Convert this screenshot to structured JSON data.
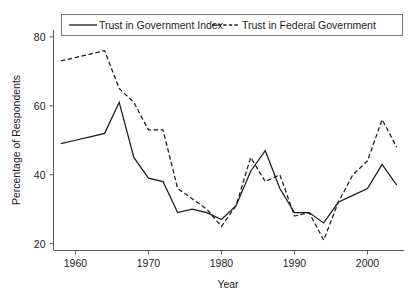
{
  "chart_data": {
    "type": "line",
    "title": "",
    "xlabel": "Year",
    "ylabel": "Percentage of Respondents",
    "xlim": [
      1957,
      2005
    ],
    "ylim": [
      18,
      82
    ],
    "xticks": [
      "1960",
      "1970",
      "1980",
      "1990",
      "2000"
    ],
    "xtick_values": [
      1960,
      1970,
      1980,
      1990,
      2000
    ],
    "yticks": [
      "20",
      "40",
      "60",
      "80"
    ],
    "ytick_values": [
      20,
      40,
      60,
      80
    ],
    "grid": false,
    "legend_position": "top",
    "series": [
      {
        "name": "Trust in Government Index",
        "style": "solid",
        "x": [
          1958,
          1960,
          1962,
          1964,
          1966,
          1968,
          1970,
          1972,
          1974,
          1976,
          1978,
          1980,
          1982,
          1984,
          1986,
          1988,
          1990,
          1992,
          1994,
          1996,
          1998,
          2000,
          2002,
          2004
        ],
        "values": [
          49,
          50,
          51,
          52,
          61,
          45,
          39,
          38,
          29,
          30,
          29,
          27,
          31,
          41,
          47,
          36,
          29,
          29,
          26,
          32,
          34,
          36,
          43,
          37
        ]
      },
      {
        "name": "Trust in Federal Government",
        "style": "dashed",
        "x": [
          1958,
          1960,
          1962,
          1964,
          1966,
          1968,
          1970,
          1972,
          1974,
          1976,
          1978,
          1980,
          1982,
          1984,
          1986,
          1988,
          1990,
          1992,
          1994,
          1996,
          1998,
          2000,
          2002,
          2004
        ],
        "values": [
          73,
          74,
          75,
          76,
          65,
          61,
          53,
          53,
          36,
          33,
          30,
          25,
          31,
          45,
          38,
          40,
          28,
          29,
          21,
          32,
          40,
          44,
          56,
          48
        ]
      }
    ]
  },
  "legend": {
    "entries": [
      {
        "label": "Trust in Government Index",
        "style": "solid"
      },
      {
        "label": "Trust in Federal Government",
        "style": "dashed"
      }
    ]
  },
  "axes": {
    "x_title": "Year",
    "y_title": "Percentage of Respondents",
    "x_tick_labels": [
      "1960",
      "1970",
      "1980",
      "1990",
      "2000"
    ],
    "y_tick_labels": [
      "20",
      "40",
      "60",
      "80"
    ]
  },
  "colors": {
    "line": "#1a1a1a",
    "axis": "#555a5e",
    "text": "#1c1c1c",
    "background": "#ffffff"
  }
}
